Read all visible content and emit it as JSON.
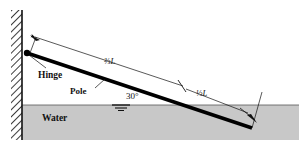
{
  "figure": {
    "background_color": "#ffffff",
    "water_color": "#c8c8c8",
    "line_color": "#111111",
    "pole_color": "#000000"
  },
  "labels": {
    "hinge": "Hinge",
    "pole": "Pole",
    "water": "Water",
    "angle": "30°",
    "upper_segment": "⅔L",
    "upper_segment_numerator": "2",
    "upper_segment_denominator": "3",
    "upper_segment_unit": "L",
    "lower_segment": "⅓L",
    "lower_segment_numerator": "1",
    "lower_segment_denominator": "3",
    "lower_segment_unit": "L"
  },
  "geometry": {
    "angle_degrees": 30,
    "pole_hinge_x": 27,
    "pole_hinge_y": 53,
    "pole_end_x": 252,
    "pole_end_y": 128,
    "water_surface_y": 105,
    "wall_x": 22,
    "wall_top_y": 10,
    "wall_bottom_y": 140
  },
  "annotations": {
    "water_level_symbol": "water-level-triangle",
    "hatching": "wall-hatch"
  }
}
